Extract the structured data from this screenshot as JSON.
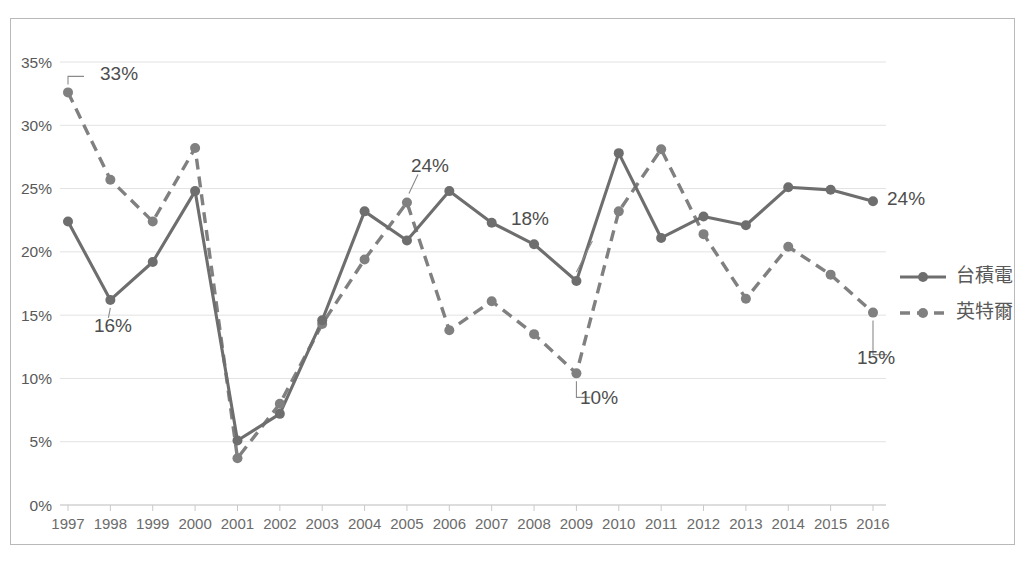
{
  "chart_data": {
    "type": "line",
    "title": "",
    "xlabel": "",
    "ylabel": "",
    "ylim": [
      0,
      35
    ],
    "ytick_labels": [
      "0%",
      "5%",
      "10%",
      "15%",
      "20%",
      "25%",
      "30%",
      "35%"
    ],
    "ytick_values": [
      0,
      5,
      10,
      15,
      20,
      25,
      30,
      35
    ],
    "grid": true,
    "legend_position": "right",
    "categories": [
      "1997",
      "1998",
      "1999",
      "2000",
      "2001",
      "2002",
      "2003",
      "2004",
      "2005",
      "2006",
      "2007",
      "2008",
      "2009",
      "2010",
      "2011",
      "2012",
      "2013",
      "2014",
      "2015",
      "2016"
    ],
    "series": [
      {
        "name": "台積電",
        "style": "solid",
        "values": [
          22.4,
          16.2,
          19.2,
          24.8,
          5.1,
          7.2,
          14.6,
          23.2,
          20.9,
          24.8,
          22.3,
          20.6,
          17.7,
          27.8,
          21.1,
          22.8,
          22.1,
          25.1,
          24.9,
          24.0
        ]
      },
      {
        "name": "英特爾",
        "style": "dashed",
        "values": [
          32.6,
          25.7,
          22.4,
          28.2,
          3.7,
          8.0,
          14.3,
          19.4,
          23.9,
          13.8,
          16.1,
          13.5,
          10.4,
          23.2,
          28.1,
          21.4,
          16.3,
          20.4,
          18.2,
          15.2
        ]
      }
    ],
    "annotations": [
      {
        "text": "33%",
        "series": "英特爾",
        "category": "1997",
        "value": 32.6
      },
      {
        "text": "16%",
        "series": "台積電",
        "category": "1998",
        "value": 16.2
      },
      {
        "text": "24%",
        "series": "英特爾",
        "category": "2005",
        "value": 23.9
      },
      {
        "text": "18%",
        "series": "台積電",
        "category": "2009",
        "value": 17.7
      },
      {
        "text": "10%",
        "series": "英特爾",
        "category": "2009",
        "value": 10.4
      },
      {
        "text": "24%",
        "series": "台積電",
        "category": "2016",
        "value": 24.0
      },
      {
        "text": "15%",
        "series": "英特爾",
        "category": "2016",
        "value": 15.2
      }
    ],
    "colors": {
      "series_solid": "#6e6e6e",
      "series_dashed": "#808080",
      "gridline": "#e2e2e2",
      "text": "#595959",
      "frame": "#b9b9b9",
      "background": "#ffffff"
    }
  },
  "legend": {
    "entries": [
      {
        "label": "台積電",
        "style": "solid"
      },
      {
        "label": "英特爾",
        "style": "dashed"
      }
    ]
  }
}
